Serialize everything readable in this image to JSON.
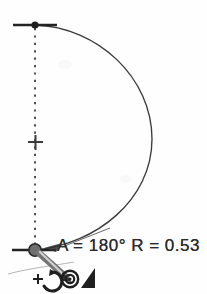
{
  "drawing": {
    "title": "CAD arc construction preview",
    "background_color": "#fefefe",
    "ink_color": "#2b2b2b",
    "handle_color": "#7a7a7a",
    "node_color": "#555555",
    "dimension_label": "A = 180° R = 0.53",
    "angle_value": "180°",
    "radius_value": "0.53",
    "angle_key": "A",
    "radius_key": "R",
    "equals": "=",
    "arc": {
      "type": "semicircular-arc",
      "start_point": [
        35,
        25
      ],
      "end_point": [
        35,
        250
      ],
      "rightmost_x": 152,
      "center": [
        35,
        142
      ],
      "sweep_degrees": 180,
      "radius_units": 0.53
    },
    "axis_line": {
      "style": "dashed",
      "from": [
        35,
        25
      ],
      "to": [
        35,
        250
      ]
    },
    "markers": {
      "top_tick_label": "top-extent-tick",
      "center_cross_label": "center-crosshair",
      "bottom_tick_label": "bottom-extent-tick"
    },
    "cursor_icons": [
      {
        "name": "rotate-arc-cursor",
        "glyph": "arc-plus"
      },
      {
        "name": "snap-center-icon",
        "glyph": "concentric-circles"
      },
      {
        "name": "delta-angle-icon",
        "glyph": "filled-triangle"
      }
    ],
    "drag_handle": {
      "name": "arc-drag-handle",
      "from": [
        38,
        252
      ],
      "to": [
        68,
        278
      ]
    }
  }
}
